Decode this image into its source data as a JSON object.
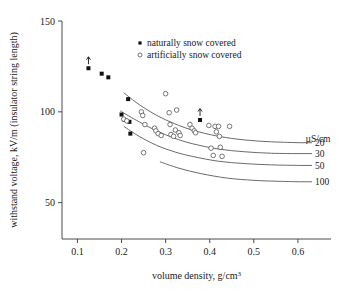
{
  "chart_data": {
    "type": "scatter",
    "title": "",
    "xlabel": "volume density, g/cm3",
    "xlabel_base": "volume density, g/cm",
    "xlabel_exp": "3",
    "ylabel": "withstand voltage, kV/m (insulator string length)",
    "xlim": [
      0.065,
      0.675
    ],
    "ylim": [
      30,
      150
    ],
    "xticks": [
      0.1,
      0.2,
      0.3,
      0.4,
      0.5,
      0.6
    ],
    "xtick_labels": [
      "0.1",
      "0.2",
      "0.3",
      "0.4",
      "0.5",
      "0.6"
    ],
    "yticks": [
      50,
      100,
      150
    ],
    "ytick_labels": [
      "50",
      "100",
      "150"
    ],
    "grid": false,
    "legend_position": "top-center",
    "legend": [
      {
        "marker": "filled-square",
        "label": "naturally snow covered"
      },
      {
        "marker": "open-circle",
        "label": "artificially snow covered"
      }
    ],
    "series": [
      {
        "name": "naturally snow covered",
        "marker": "filled-square",
        "points": [
          {
            "x": 0.125,
            "y": 124.0,
            "arrow": true
          },
          {
            "x": 0.155,
            "y": 121.0
          },
          {
            "x": 0.17,
            "y": 119.0
          },
          {
            "x": 0.215,
            "y": 107.0
          },
          {
            "x": 0.2,
            "y": 98.5
          },
          {
            "x": 0.207,
            "y": 95.5
          },
          {
            "x": 0.218,
            "y": 94.5
          },
          {
            "x": 0.22,
            "y": 88.0
          },
          {
            "x": 0.378,
            "y": 95.5,
            "arrow": true
          }
        ]
      },
      {
        "name": "artificially snow covered",
        "marker": "open-circle",
        "points": [
          {
            "x": 0.205,
            "y": 96.0
          },
          {
            "x": 0.212,
            "y": 95.0
          },
          {
            "x": 0.245,
            "y": 100.0
          },
          {
            "x": 0.248,
            "y": 98.0
          },
          {
            "x": 0.253,
            "y": 93.0
          },
          {
            "x": 0.25,
            "y": 77.5
          },
          {
            "x": 0.275,
            "y": 91.0
          },
          {
            "x": 0.278,
            "y": 89.5
          },
          {
            "x": 0.283,
            "y": 88.0
          },
          {
            "x": 0.29,
            "y": 87.0
          },
          {
            "x": 0.3,
            "y": 110.0
          },
          {
            "x": 0.308,
            "y": 99.5
          },
          {
            "x": 0.31,
            "y": 93.0
          },
          {
            "x": 0.312,
            "y": 87.5
          },
          {
            "x": 0.318,
            "y": 86.5
          },
          {
            "x": 0.322,
            "y": 90.0
          },
          {
            "x": 0.325,
            "y": 101.0
          },
          {
            "x": 0.33,
            "y": 88.5
          },
          {
            "x": 0.333,
            "y": 87.0
          },
          {
            "x": 0.355,
            "y": 93.0
          },
          {
            "x": 0.36,
            "y": 91.0
          },
          {
            "x": 0.365,
            "y": 89.5
          },
          {
            "x": 0.368,
            "y": 88.5
          },
          {
            "x": 0.398,
            "y": 92.5
          },
          {
            "x": 0.403,
            "y": 80.0
          },
          {
            "x": 0.408,
            "y": 76.0
          },
          {
            "x": 0.412,
            "y": 92.0
          },
          {
            "x": 0.415,
            "y": 89.0
          },
          {
            "x": 0.42,
            "y": 92.0
          },
          {
            "x": 0.422,
            "y": 86.5
          },
          {
            "x": 0.424,
            "y": 80.5
          },
          {
            "x": 0.428,
            "y": 75.5
          },
          {
            "x": 0.445,
            "y": 92.0
          }
        ]
      }
    ],
    "curves": [
      {
        "label": "20",
        "x_start": 0.205,
        "x_end": 0.605,
        "points": [
          {
            "x": 0.205,
            "y": 110.5
          },
          {
            "x": 0.24,
            "y": 104.0
          },
          {
            "x": 0.28,
            "y": 98.0
          },
          {
            "x": 0.32,
            "y": 93.5
          },
          {
            "x": 0.36,
            "y": 90.0
          },
          {
            "x": 0.42,
            "y": 86.5
          },
          {
            "x": 0.48,
            "y": 84.5
          },
          {
            "x": 0.54,
            "y": 83.5
          },
          {
            "x": 0.605,
            "y": 83.0
          }
        ]
      },
      {
        "label": "30",
        "x_start": 0.197,
        "x_end": 0.605,
        "points": [
          {
            "x": 0.197,
            "y": 100.5
          },
          {
            "x": 0.24,
            "y": 94.5
          },
          {
            "x": 0.28,
            "y": 89.5
          },
          {
            "x": 0.32,
            "y": 85.5
          },
          {
            "x": 0.36,
            "y": 82.5
          },
          {
            "x": 0.42,
            "y": 79.5
          },
          {
            "x": 0.48,
            "y": 78.0
          },
          {
            "x": 0.54,
            "y": 77.2
          },
          {
            "x": 0.605,
            "y": 77.0
          }
        ]
      },
      {
        "label": "50",
        "x_start": 0.205,
        "x_end": 0.605,
        "points": [
          {
            "x": 0.205,
            "y": 92.0
          },
          {
            "x": 0.24,
            "y": 86.5
          },
          {
            "x": 0.28,
            "y": 81.5
          },
          {
            "x": 0.32,
            "y": 78.0
          },
          {
            "x": 0.36,
            "y": 75.5
          },
          {
            "x": 0.42,
            "y": 72.8
          },
          {
            "x": 0.48,
            "y": 71.5
          },
          {
            "x": 0.54,
            "y": 70.8
          },
          {
            "x": 0.605,
            "y": 70.5
          }
        ]
      },
      {
        "label": "100",
        "x_start": 0.287,
        "x_end": 0.605,
        "points": [
          {
            "x": 0.287,
            "y": 72.5
          },
          {
            "x": 0.33,
            "y": 69.0
          },
          {
            "x": 0.38,
            "y": 66.0
          },
          {
            "x": 0.44,
            "y": 63.5
          },
          {
            "x": 0.5,
            "y": 62.3
          },
          {
            "x": 0.55,
            "y": 61.8
          },
          {
            "x": 0.605,
            "y": 61.5
          }
        ]
      }
    ],
    "curve_units": "µS/cm"
  }
}
